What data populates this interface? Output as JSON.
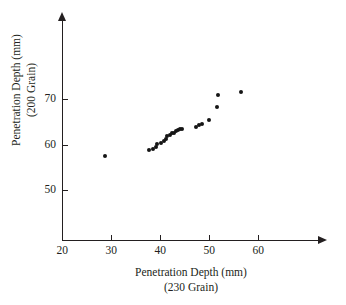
{
  "chart_data": {
    "type": "scatter",
    "title": "",
    "xlabel": "Penetration Depth (mm) (230 Grain)",
    "ylabel": "Penetration Depth (mm) (200 Grain)",
    "xlabel_line1": "Penetration Depth (mm)",
    "xlabel_line2": "(230 Grain)",
    "ylabel_line1": "Penetration Depth (mm)",
    "ylabel_line2": "(200 Grain)",
    "xlim": [
      17.5,
      72.5
    ],
    "ylim": [
      44.5,
      77.0
    ],
    "xticks": [
      20,
      30,
      40,
      50,
      60
    ],
    "yticks": [
      50,
      60,
      70
    ],
    "xtick_labels": [
      "20",
      "30",
      "40",
      "50",
      "60"
    ],
    "ytick_labels": [
      "50",
      "60",
      "70"
    ],
    "grid": false,
    "legend": false,
    "marker_color": "#151515",
    "axis_color": "#231f20",
    "background": "#ffffff",
    "points": [
      {
        "x": 28.7,
        "y": 57.5
      },
      {
        "x": 37.6,
        "y": 58.9
      },
      {
        "x": 38.6,
        "y": 59.1
      },
      {
        "x": 39.2,
        "y": 59.4
      },
      {
        "x": 39.4,
        "y": 60.1
      },
      {
        "x": 40.2,
        "y": 60.3
      },
      {
        "x": 40.8,
        "y": 60.8
      },
      {
        "x": 41.2,
        "y": 61.2
      },
      {
        "x": 41.4,
        "y": 61.9
      },
      {
        "x": 42.0,
        "y": 62.1
      },
      {
        "x": 42.4,
        "y": 62.5
      },
      {
        "x": 42.8,
        "y": 62.6
      },
      {
        "x": 43.2,
        "y": 63.0
      },
      {
        "x": 43.6,
        "y": 63.2
      },
      {
        "x": 44.0,
        "y": 63.4
      },
      {
        "x": 44.4,
        "y": 63.5
      },
      {
        "x": 47.2,
        "y": 63.8
      },
      {
        "x": 47.8,
        "y": 64.4
      },
      {
        "x": 48.4,
        "y": 64.6
      },
      {
        "x": 50.0,
        "y": 65.5
      },
      {
        "x": 51.6,
        "y": 68.3
      },
      {
        "x": 51.8,
        "y": 70.9
      },
      {
        "x": 56.4,
        "y": 71.5
      }
    ]
  }
}
